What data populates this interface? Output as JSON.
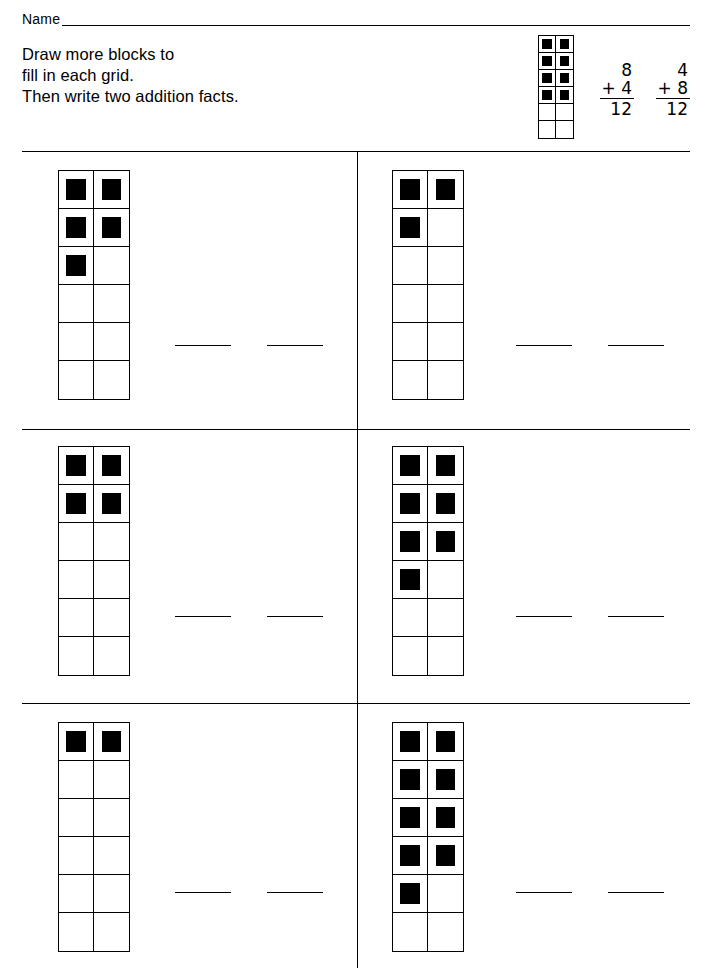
{
  "page": {
    "width": 713,
    "height": 974,
    "ink_color": "#000000",
    "paper_color": "#ffffff"
  },
  "name_field": {
    "label": "Name",
    "value": "",
    "placeholder": ""
  },
  "instructions": {
    "line1": "Draw more blocks to",
    "line2": "fill in each grid.",
    "line3": "Then write two addition facts."
  },
  "example": {
    "grid": {
      "rows": 6,
      "columns": 2,
      "filled_count": 8,
      "empty_count": 4,
      "cells": [
        [
          true,
          true
        ],
        [
          true,
          true
        ],
        [
          true,
          true
        ],
        [
          true,
          true
        ],
        [
          false,
          false
        ],
        [
          false,
          false
        ]
      ]
    },
    "facts": [
      {
        "addend_top": "8",
        "operator": "+",
        "addend_bottom": "4",
        "sum": "12"
      },
      {
        "addend_top": "4",
        "operator": "+",
        "addend_bottom": "8",
        "sum": "12"
      }
    ]
  },
  "problems": [
    {
      "id": "problem-1",
      "position": "row1-left",
      "grid": {
        "rows": 6,
        "columns": 2,
        "filled_count": 5,
        "empty_count": 7,
        "cells": [
          [
            true,
            true
          ],
          [
            true,
            true
          ],
          [
            true,
            false
          ],
          [
            false,
            false
          ],
          [
            false,
            false
          ],
          [
            false,
            false
          ]
        ]
      },
      "answer_blanks": [
        "",
        ""
      ]
    },
    {
      "id": "problem-2",
      "position": "row1-right",
      "grid": {
        "rows": 6,
        "columns": 2,
        "filled_count": 3,
        "empty_count": 9,
        "cells": [
          [
            true,
            true
          ],
          [
            true,
            false
          ],
          [
            false,
            false
          ],
          [
            false,
            false
          ],
          [
            false,
            false
          ],
          [
            false,
            false
          ]
        ]
      },
      "answer_blanks": [
        "",
        ""
      ]
    },
    {
      "id": "problem-3",
      "position": "row2-left",
      "grid": {
        "rows": 6,
        "columns": 2,
        "filled_count": 4,
        "empty_count": 8,
        "cells": [
          [
            true,
            true
          ],
          [
            true,
            true
          ],
          [
            false,
            false
          ],
          [
            false,
            false
          ],
          [
            false,
            false
          ],
          [
            false,
            false
          ]
        ]
      },
      "answer_blanks": [
        "",
        ""
      ]
    },
    {
      "id": "problem-4",
      "position": "row2-right",
      "grid": {
        "rows": 6,
        "columns": 2,
        "filled_count": 7,
        "empty_count": 5,
        "cells": [
          [
            true,
            true
          ],
          [
            true,
            true
          ],
          [
            true,
            true
          ],
          [
            true,
            false
          ],
          [
            false,
            false
          ],
          [
            false,
            false
          ]
        ]
      },
      "answer_blanks": [
        "",
        ""
      ]
    },
    {
      "id": "problem-5",
      "position": "row3-left",
      "grid": {
        "rows": 6,
        "columns": 2,
        "filled_count": 2,
        "empty_count": 10,
        "cells": [
          [
            true,
            true
          ],
          [
            false,
            false
          ],
          [
            false,
            false
          ],
          [
            false,
            false
          ],
          [
            false,
            false
          ],
          [
            false,
            false
          ]
        ]
      },
      "answer_blanks": [
        "",
        ""
      ]
    },
    {
      "id": "problem-6",
      "position": "row3-right",
      "grid": {
        "rows": 6,
        "columns": 2,
        "filled_count": 9,
        "empty_count": 3,
        "cells": [
          [
            true,
            true
          ],
          [
            true,
            true
          ],
          [
            true,
            true
          ],
          [
            true,
            true
          ],
          [
            true,
            false
          ],
          [
            false,
            false
          ]
        ]
      },
      "answer_blanks": [
        "",
        ""
      ]
    }
  ]
}
